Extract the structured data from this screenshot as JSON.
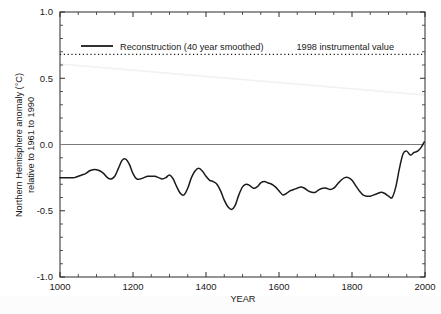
{
  "chart_data": {
    "type": "line",
    "title": "",
    "xlabel": "YEAR",
    "ylabel": "Northern Hemisphere anomaly (°C) relative to 1961 to 1990",
    "ylabel_line1": "Northern Hemisphere anomaly (°C)",
    "ylabel_line2": "relative to 1961 to 1990",
    "xlim": [
      1000,
      2000
    ],
    "ylim": [
      -1.0,
      1.0
    ],
    "xticks": [
      1000,
      1200,
      1400,
      1600,
      1800,
      2000
    ],
    "xtick_labels": [
      "1000",
      "1200",
      "1400",
      "1600",
      "1800",
      "2000"
    ],
    "xminor_step": 50,
    "yticks": [
      -1.0,
      -0.5,
      0.0,
      0.5,
      1.0
    ],
    "ytick_labels": [
      "-1.0",
      "-0.5",
      "0.0",
      "0.5",
      "1.0"
    ],
    "yminor_step": 0.1,
    "grid": false,
    "legend_position": "top-left-inside",
    "series": [
      {
        "name": "Reconstruction (40 year smoothed)",
        "style": "solid",
        "color": "#1a1a1a",
        "x": [
          1000,
          1010,
          1020,
          1030,
          1040,
          1050,
          1060,
          1070,
          1080,
          1090,
          1100,
          1110,
          1120,
          1130,
          1140,
          1150,
          1160,
          1170,
          1180,
          1190,
          1200,
          1210,
          1220,
          1230,
          1240,
          1250,
          1260,
          1270,
          1280,
          1290,
          1300,
          1310,
          1320,
          1330,
          1340,
          1350,
          1360,
          1370,
          1380,
          1390,
          1400,
          1410,
          1420,
          1430,
          1440,
          1450,
          1460,
          1470,
          1480,
          1490,
          1500,
          1510,
          1520,
          1530,
          1540,
          1550,
          1560,
          1570,
          1580,
          1590,
          1600,
          1610,
          1620,
          1630,
          1640,
          1650,
          1660,
          1670,
          1680,
          1690,
          1700,
          1710,
          1720,
          1730,
          1740,
          1750,
          1760,
          1770,
          1780,
          1790,
          1800,
          1810,
          1820,
          1830,
          1840,
          1850,
          1860,
          1870,
          1880,
          1890,
          1900,
          1910,
          1920,
          1930,
          1940,
          1950,
          1960,
          1970,
          1980,
          1990,
          1998
        ],
        "y": [
          -0.25,
          -0.25,
          -0.25,
          -0.25,
          -0.25,
          -0.24,
          -0.23,
          -0.22,
          -0.2,
          -0.19,
          -0.19,
          -0.2,
          -0.22,
          -0.25,
          -0.26,
          -0.24,
          -0.18,
          -0.12,
          -0.11,
          -0.15,
          -0.22,
          -0.26,
          -0.26,
          -0.25,
          -0.24,
          -0.24,
          -0.24,
          -0.25,
          -0.26,
          -0.25,
          -0.23,
          -0.26,
          -0.32,
          -0.37,
          -0.38,
          -0.33,
          -0.25,
          -0.2,
          -0.18,
          -0.2,
          -0.24,
          -0.27,
          -0.28,
          -0.3,
          -0.35,
          -0.42,
          -0.47,
          -0.49,
          -0.46,
          -0.38,
          -0.32,
          -0.3,
          -0.31,
          -0.33,
          -0.32,
          -0.29,
          -0.28,
          -0.29,
          -0.3,
          -0.32,
          -0.35,
          -0.38,
          -0.37,
          -0.35,
          -0.34,
          -0.33,
          -0.32,
          -0.33,
          -0.35,
          -0.36,
          -0.36,
          -0.34,
          -0.33,
          -0.33,
          -0.34,
          -0.33,
          -0.3,
          -0.27,
          -0.25,
          -0.25,
          -0.27,
          -0.31,
          -0.35,
          -0.38,
          -0.39,
          -0.39,
          -0.38,
          -0.37,
          -0.36,
          -0.37,
          -0.39,
          -0.4,
          -0.32,
          -0.18,
          -0.07,
          -0.05,
          -0.08,
          -0.06,
          -0.05,
          -0.02,
          0.02
        ]
      }
    ],
    "reference_lines": [
      {
        "name": "1998 instrumental value",
        "label": "1998 instrumental value",
        "value": 0.68,
        "orientation": "horizontal",
        "style": "dotted",
        "color": "#1a1a1a"
      },
      {
        "name": "zero line",
        "label": "",
        "value": 0.0,
        "orientation": "horizontal",
        "style": "solid",
        "color": "#7a7a7a"
      }
    ],
    "legend": [
      {
        "label": "Reconstruction (40 year smoothed)",
        "style": "solid",
        "color": "#1a1a1a"
      }
    ],
    "annotations": [
      {
        "label": "1998 instrumental value",
        "x": 1790,
        "y": 0.78
      }
    ]
  },
  "axes": {
    "y_axis_label_line1": "Northern Hemisphere anomaly (°C)",
    "y_axis_label_line2": "relative to 1961 to 1990",
    "x_axis_label": "YEAR"
  },
  "colors": {
    "line": "#1a1a1a",
    "zero_line": "#7a7a7a",
    "axis": "#2b2b2b",
    "background": "#ffffff",
    "text": "#1a1a1a"
  }
}
